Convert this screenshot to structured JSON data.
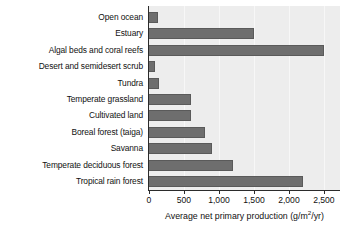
{
  "chart_data": {
    "type": "bar",
    "orientation": "horizontal",
    "title": "",
    "xlabel": "Average net primary production (g/m2/yr)",
    "xlabel_prefix": "Average net primary production (g/m",
    "xlabel_exponent": "2",
    "xlabel_suffix": "/yr)",
    "ylabel": "",
    "categories": [
      "Open ocean",
      "Estuary",
      "Algal beds and coral reefs",
      "Desert and semidesert scrub",
      "Tundra",
      "Temperate grassland",
      "Cultivated land",
      "Boreal forest (taiga)",
      "Savanna",
      "Temperate deciduous forest",
      "Tropical rain forest"
    ],
    "values": [
      125,
      1500,
      2500,
      90,
      140,
      600,
      600,
      800,
      900,
      1200,
      2200
    ],
    "xlim": [
      0,
      2730
    ],
    "xticks": [
      0,
      500,
      1000,
      1500,
      2000,
      2500
    ],
    "xtick_labels": [
      "0",
      "500",
      "1,000",
      "1,500",
      "2,000",
      "2,500"
    ],
    "grid": "vertical-faint",
    "legend": "none",
    "colors": {
      "bar_fill": "#6e6e6e",
      "bar_stroke": "#5a5a5a",
      "plot_background": "#ededed",
      "gridline": "#f7f7f7",
      "axis": "#2b2b2b",
      "text": "#111111",
      "page_background": "#ffffff"
    }
  }
}
